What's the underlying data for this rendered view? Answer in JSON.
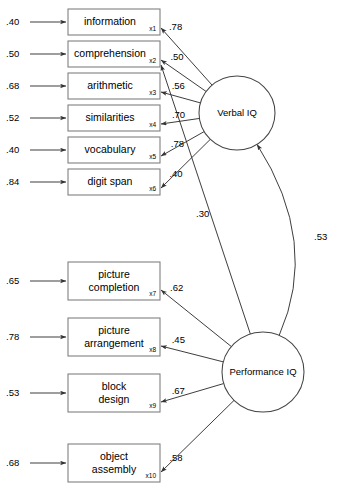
{
  "diagram": {
    "type": "sem-path-diagram",
    "latents": [
      {
        "id": "verbal",
        "label": "Verbal IQ",
        "cx": 237,
        "cy": 113,
        "rx": 38,
        "ry": 37
      },
      {
        "id": "performance",
        "label": "Performance IQ",
        "cx": 263,
        "cy": 372,
        "rx": 41,
        "ry": 40
      }
    ],
    "indicators": [
      {
        "id": "x1",
        "label_line1": "information",
        "label_line2": "",
        "sub": "x1",
        "residual": ".40",
        "loading": ".78",
        "factor": "verbal",
        "x": 68,
        "y": 9,
        "w": 92,
        "h": 26
      },
      {
        "id": "x2",
        "label_line1": "comprehension",
        "label_line2": "",
        "sub": "x2",
        "residual": ".50",
        "loading": ".50",
        "factor": "verbal",
        "x": 68,
        "y": 41,
        "w": 92,
        "h": 26
      },
      {
        "id": "x3",
        "label_line1": "arithmetic",
        "label_line2": "",
        "sub": "x3",
        "residual": ".68",
        "loading": ".56",
        "factor": "verbal",
        "x": 68,
        "y": 73,
        "w": 92,
        "h": 26
      },
      {
        "id": "x4",
        "label_line1": "similarities",
        "label_line2": "",
        "sub": "x4",
        "residual": ".52",
        "loading": ".70",
        "factor": "verbal",
        "x": 68,
        "y": 105,
        "w": 92,
        "h": 26
      },
      {
        "id": "x5",
        "label_line1": "vocabulary",
        "label_line2": "",
        "sub": "x5",
        "residual": ".40",
        "loading": ".78",
        "factor": "verbal",
        "x": 68,
        "y": 137,
        "w": 92,
        "h": 26
      },
      {
        "id": "x6",
        "label_line1": "digit span",
        "label_line2": "",
        "sub": "x6",
        "residual": ".84",
        "loading": ".40",
        "factor": "verbal",
        "x": 68,
        "y": 169,
        "w": 92,
        "h": 26
      },
      {
        "id": "x7",
        "label_line1": "picture",
        "label_line2": "completion",
        "sub": "x7",
        "residual": ".65",
        "loading": ".62",
        "factor": "performance",
        "x": 68,
        "y": 262,
        "w": 92,
        "h": 38
      },
      {
        "id": "x8",
        "label_line1": "picture",
        "label_line2": "arrangement",
        "sub": "x8",
        "residual": ".78",
        "loading": ".45",
        "factor": "performance",
        "x": 68,
        "y": 318,
        "w": 92,
        "h": 38
      },
      {
        "id": "x9",
        "label_line1": "block",
        "label_line2": "design",
        "sub": "x9",
        "residual": ".53",
        "loading": ".67",
        "factor": "performance",
        "x": 68,
        "y": 374,
        "w": 92,
        "h": 38
      },
      {
        "id": "x10",
        "label_line1": "object",
        "label_line2": "assembly",
        "sub": "x10",
        "residual": ".68",
        "loading": ".58",
        "factor": "performance",
        "x": 68,
        "y": 444,
        "w": 92,
        "h": 38
      }
    ],
    "cross_loading": {
      "id": "cross-performance-x2",
      "from": "performance",
      "to": "x2",
      "value": ".30",
      "label_x": 196,
      "label_y": 217
    },
    "covariance": {
      "id": "cov-verbal-performance",
      "between": [
        "verbal",
        "performance"
      ],
      "value": ".53",
      "label_x": 314,
      "label_y": 240
    },
    "colors": {
      "background": "#ffffff",
      "box_stroke": "#808080",
      "ellipse_stroke": "#444444",
      "path_stroke": "#333333",
      "text": "#000000"
    }
  }
}
